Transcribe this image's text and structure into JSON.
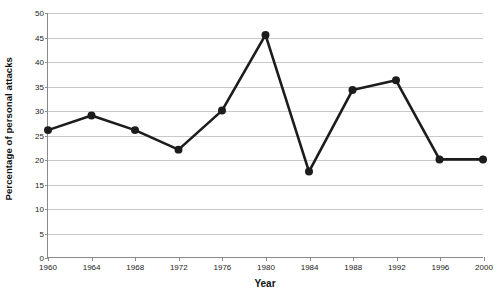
{
  "chart_data": {
    "type": "line",
    "title": "",
    "xlabel": "Year",
    "ylabel": "Percentage of personal attacks",
    "x": [
      1960,
      1964,
      1968,
      1972,
      1976,
      1980,
      1984,
      1988,
      1992,
      1996,
      2000
    ],
    "values": [
      26,
      29,
      26,
      22,
      30,
      45.5,
      17.5,
      34.2,
      36.2,
      20,
      20
    ],
    "xtick_labels": [
      "1960",
      "1964",
      "1968",
      "1972",
      "1976",
      "1980",
      "1984",
      "1988",
      "1992",
      "1996",
      "2000"
    ],
    "ytick_labels": [
      "0",
      "5",
      "10",
      "15",
      "20",
      "25",
      "30",
      "35",
      "40",
      "45",
      "50"
    ],
    "ytick_values": [
      0,
      5,
      10,
      15,
      20,
      25,
      30,
      35,
      40,
      45,
      50
    ],
    "ylim": [
      0,
      50
    ],
    "xlim": [
      1960,
      2000
    ],
    "grid": "horizontal",
    "legend": "none",
    "series_color": "#1c1c1c",
    "marker": "circle",
    "gridline_color": "#c9c9c9",
    "axis_color": "#8a8a8a"
  },
  "top_partial_text": ""
}
